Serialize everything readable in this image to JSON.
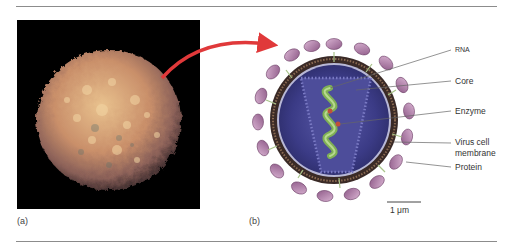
{
  "figure": {
    "panels": [
      {
        "id": "a",
        "label": "(a)",
        "description": "Scanning electron micrograph of a lymphocyte (T cell)"
      },
      {
        "id": "b",
        "label": "(b)",
        "description": "Schematic cross-section of HIV virus particle"
      }
    ],
    "virus_labels": {
      "rna": "RNA",
      "core": "Core",
      "enzyme": "Enzyme",
      "membrane_line1": "Virus cell",
      "membrane_line2": "membrane",
      "protein": "Protein"
    },
    "scale_bar": "1 μm",
    "colors": {
      "arrow": "#e0393a",
      "protein_knob": "#b07aa8",
      "membrane": "#3a2a26",
      "core_fill": "#3f3f8c",
      "rna": "#7fb055",
      "enzyme": "#c0503a",
      "cell": "#d9a27a"
    }
  }
}
